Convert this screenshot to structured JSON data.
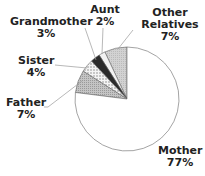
{
  "chart_data": {
    "type": "pie",
    "title": "",
    "start_angle_deg": 90,
    "direction": "counterclockwise",
    "slices": [
      {
        "label": "Other Relatives",
        "value": 7,
        "display": "7%",
        "fill": "#c8c8c8",
        "pattern": "light-gray"
      },
      {
        "label": "Aunt",
        "value": 2,
        "display": "2%",
        "fill": "#f2f2f2",
        "pattern": "white"
      },
      {
        "label": "Grandmother",
        "value": 3,
        "display": "3%",
        "fill": "#2b2b2b",
        "pattern": "dark"
      },
      {
        "label": "Sister",
        "value": 4,
        "display": "4%",
        "fill": "#e6e6e6",
        "pattern": "dotted"
      },
      {
        "label": "Father",
        "value": 7,
        "display": "7%",
        "fill": "#bdbdbd",
        "pattern": "gray-hatch"
      },
      {
        "label": "Mother",
        "value": 77,
        "display": "77%",
        "fill": "#ffffff",
        "pattern": "white"
      }
    ],
    "legend": "none (direct labels)"
  },
  "labels": {
    "other": {
      "name": "Other",
      "name2": "Relatives",
      "pct": "7%"
    },
    "aunt": {
      "name": "Aunt",
      "pct": "2%"
    },
    "grandmother": {
      "name": "Grandmother",
      "pct": "3%"
    },
    "sister": {
      "name": "Sister",
      "pct": "4%"
    },
    "father": {
      "name": "Father",
      "pct": "7%"
    },
    "mother": {
      "name": "Mother",
      "pct": "77%"
    }
  }
}
